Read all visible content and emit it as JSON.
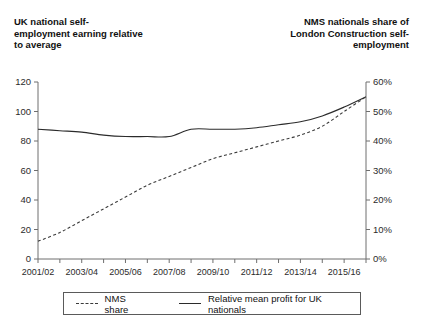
{
  "chart_data": {
    "type": "line",
    "title": "",
    "left_axis": {
      "label": "UK national self-employment earning relative to average",
      "ticks": [
        0,
        20,
        40,
        60,
        80,
        100,
        120
      ],
      "ylim": [
        0,
        120
      ]
    },
    "right_axis": {
      "label": "NMS nationals share of London Construction self-employment",
      "ticks": [
        "0%",
        "10%",
        "20%",
        "30%",
        "40%",
        "50%",
        "60%"
      ],
      "ylim": [
        0,
        60
      ]
    },
    "xlabel": "",
    "grid": false,
    "legend_position": "bottom",
    "categories": [
      "2001/02",
      "2002/03",
      "2003/04",
      "2004/05",
      "2005/06",
      "2006/07",
      "2007/08",
      "2008/09",
      "2009/10",
      "2010/11",
      "2011/12",
      "2012/13",
      "2013/14",
      "2014/15",
      "2015/16",
      "2016/17"
    ],
    "x_tick_labels": [
      "2001/02",
      "2003/04",
      "2005/06",
      "2007/08",
      "2009/10",
      "2011/12",
      "2013/14",
      "2015/16"
    ],
    "series": [
      {
        "name": "NMS share",
        "axis": "right",
        "style": "dashed",
        "color": "#3a3a3a",
        "values": [
          6,
          9,
          13,
          17,
          21,
          25,
          28,
          31,
          34,
          36,
          38,
          40,
          42,
          45,
          50,
          55
        ]
      },
      {
        "name": "Relative mean profit for UK nationals",
        "axis": "left",
        "style": "solid",
        "color": "#2b2b2b",
        "values": [
          88,
          87,
          86,
          84,
          83,
          83,
          83,
          88,
          88,
          88,
          89,
          91,
          93,
          97,
          103,
          110
        ]
      }
    ],
    "legend": [
      {
        "label": "NMS share",
        "style": "dashed"
      },
      {
        "label": "Relative mean profit for UK nationals",
        "style": "solid"
      }
    ]
  }
}
